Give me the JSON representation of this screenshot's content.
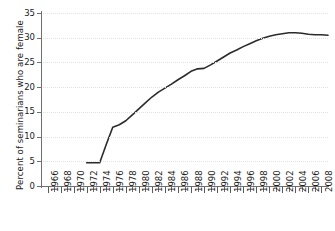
{
  "chart_data": {
    "type": "line",
    "title": "",
    "xlabel": "",
    "ylabel": "Percent of seminarians who are female",
    "xlim": [
      1965,
      2009
    ],
    "ylim": [
      0,
      35
    ],
    "yticks": [
      0,
      5,
      10,
      15,
      20,
      25,
      30,
      35
    ],
    "xticks_labeled": [
      1966,
      1968,
      1970,
      1972,
      1974,
      1976,
      1978,
      1980,
      1982,
      1984,
      1986,
      1988,
      1990,
      1992,
      1994,
      1996,
      1998,
      2000,
      2002,
      2004,
      2006,
      2008
    ],
    "xticks_minor_every": 1,
    "grid": "horizontal-dotted",
    "legend": "none",
    "line_color": "#2b2b2b",
    "grid_color": "#e2e2e2",
    "axis_color": "#6f6f6f",
    "x": [
      1972,
      1973,
      1974,
      1975,
      1976,
      1977,
      1978,
      1979,
      1980,
      1981,
      1982,
      1983,
      1984,
      1985,
      1986,
      1987,
      1988,
      1989,
      1990,
      1991,
      1992,
      1993,
      1994,
      1995,
      1996,
      1997,
      1998,
      1999,
      2000,
      2001,
      2002,
      2003,
      2004,
      2005,
      2006,
      2007,
      2008,
      2009
    ],
    "values": [
      4.7,
      4.7,
      4.7,
      8.4,
      11.9,
      12.4,
      13.2,
      14.4,
      15.6,
      16.8,
      18.0,
      19.0,
      19.8,
      20.6,
      21.5,
      22.3,
      23.2,
      23.7,
      23.8,
      24.5,
      25.3,
      26.1,
      26.9,
      27.5,
      28.2,
      28.8,
      29.4,
      29.9,
      30.3,
      30.6,
      30.8,
      31.0,
      31.0,
      30.9,
      30.7,
      30.6,
      30.6,
      30.5
    ],
    "series_name": "Percent of seminarians who are female"
  }
}
